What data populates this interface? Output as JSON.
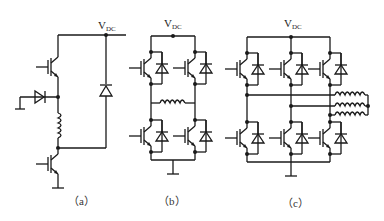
{
  "diagram": {
    "labels": {
      "vdc_a": {
        "main": "V",
        "sub": "DC"
      },
      "vdc_b": {
        "main": "V",
        "sub": "DC"
      },
      "vdc_c": {
        "main": "V",
        "sub": "DC"
      }
    },
    "captions": {
      "a": "（a）",
      "b": "（b）",
      "c": "（c）"
    },
    "panels": [
      {
        "id": "a",
        "description": "Two IGBTs in series with inductor, freewheel diode to ground, and a diode from VDC rail"
      },
      {
        "id": "b",
        "description": "H-bridge of four IGBTs with antiparallel diodes and inductor across mid-points"
      },
      {
        "id": "c",
        "description": "Three-phase bridge of six IGBTs with antiparallel diodes and three inductors joined at a star point"
      }
    ],
    "colors": {
      "stroke": "#1a1a1a",
      "background": "#ffffff"
    }
  }
}
